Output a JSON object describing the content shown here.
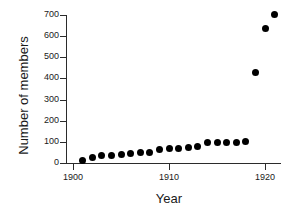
{
  "chart_data": {
    "type": "scatter",
    "title": "",
    "xlabel": "Year",
    "ylabel": "Number of members",
    "xlim": [
      1899.5,
      1922
    ],
    "ylim": [
      0,
      740
    ],
    "xticks": [
      1900,
      1910,
      1920
    ],
    "xtick_labels": [
      "1900",
      "1910",
      "1920"
    ],
    "yticks": [
      0,
      100,
      200,
      300,
      400,
      500,
      600,
      700
    ],
    "ytick_labels": [
      "0",
      "100",
      "200",
      "300",
      "400",
      "500",
      "600",
      "700"
    ],
    "grid": false,
    "legend": null,
    "marker": "filled-circle",
    "marker_color": "#000000",
    "x": [
      1901,
      1902,
      1903,
      1904,
      1905,
      1906,
      1907,
      1908,
      1909,
      1910,
      1911,
      1912,
      1913,
      1914,
      1915,
      1916,
      1917,
      1918,
      1919,
      1920,
      1921
    ],
    "y": [
      14,
      26,
      34,
      35,
      41,
      47,
      51,
      51,
      62,
      68,
      69,
      75,
      80,
      96,
      97,
      96,
      96,
      101,
      428,
      634,
      703
    ],
    "points": [
      {
        "x": 1901,
        "y": 14
      },
      {
        "x": 1902,
        "y": 26
      },
      {
        "x": 1903,
        "y": 34
      },
      {
        "x": 1904,
        "y": 35
      },
      {
        "x": 1905,
        "y": 41
      },
      {
        "x": 1906,
        "y": 47
      },
      {
        "x": 1907,
        "y": 51
      },
      {
        "x": 1908,
        "y": 51
      },
      {
        "x": 1909,
        "y": 62
      },
      {
        "x": 1910,
        "y": 68
      },
      {
        "x": 1911,
        "y": 69
      },
      {
        "x": 1912,
        "y": 75
      },
      {
        "x": 1913,
        "y": 80
      },
      {
        "x": 1914,
        "y": 96
      },
      {
        "x": 1915,
        "y": 97
      },
      {
        "x": 1916,
        "y": 96
      },
      {
        "x": 1917,
        "y": 96
      },
      {
        "x": 1918,
        "y": 101
      },
      {
        "x": 1919,
        "y": 428
      },
      {
        "x": 1920,
        "y": 634
      },
      {
        "x": 1921,
        "y": 703
      }
    ]
  },
  "axes": {
    "x_label_text": "Year",
    "y_label_text": "Number of members"
  }
}
